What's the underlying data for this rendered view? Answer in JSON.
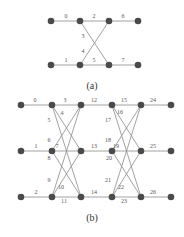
{
  "colors": {
    "node": "#4a4a4a",
    "edge": "#8a8a8a",
    "label": "#555555",
    "background": "#ffffff"
  },
  "diagram_a": {
    "caption": "(a)",
    "nodes": [
      {
        "id": "a0",
        "x": 51,
        "y": 21
      },
      {
        "id": "a1",
        "x": 80,
        "y": 21
      },
      {
        "id": "a2",
        "x": 109,
        "y": 21
      },
      {
        "id": "a3",
        "x": 138,
        "y": 21
      },
      {
        "id": "a4",
        "x": 51,
        "y": 65
      },
      {
        "id": "a5",
        "x": 80,
        "y": 65
      },
      {
        "id": "a6",
        "x": 109,
        "y": 65
      },
      {
        "id": "a7",
        "x": 138,
        "y": 65
      }
    ],
    "edges": [
      {
        "label": "0",
        "from": "a0",
        "to": "a1",
        "lx": 66,
        "ly": 18
      },
      {
        "label": "1",
        "from": "a4",
        "to": "a5",
        "lx": 66,
        "ly": 62
      },
      {
        "label": "2",
        "from": "a1",
        "to": "a2",
        "lx": 94,
        "ly": 18
      },
      {
        "label": "3",
        "from": "a1",
        "to": "a6",
        "lx": 83,
        "ly": 38
      },
      {
        "label": "4",
        "from": "a5",
        "to": "a2",
        "lx": 83,
        "ly": 53
      },
      {
        "label": "5",
        "from": "a5",
        "to": "a6",
        "lx": 94,
        "ly": 62
      },
      {
        "label": "6",
        "from": "a2",
        "to": "a3",
        "lx": 123,
        "ly": 18
      },
      {
        "label": "7",
        "from": "a6",
        "to": "a7",
        "lx": 123,
        "ly": 62
      }
    ]
  },
  "diagram_b": {
    "caption": "(b)",
    "nodes": [
      {
        "id": "b00",
        "x": 21,
        "y": 105
      },
      {
        "id": "b01",
        "x": 21,
        "y": 151
      },
      {
        "id": "b02",
        "x": 21,
        "y": 197
      },
      {
        "id": "b10",
        "x": 52,
        "y": 105
      },
      {
        "id": "b11",
        "x": 52,
        "y": 151
      },
      {
        "id": "b12",
        "x": 52,
        "y": 197
      },
      {
        "id": "b20",
        "x": 81,
        "y": 105
      },
      {
        "id": "b21",
        "x": 81,
        "y": 151
      },
      {
        "id": "b22",
        "x": 81,
        "y": 197
      },
      {
        "id": "b30",
        "x": 112,
        "y": 105
      },
      {
        "id": "b31",
        "x": 112,
        "y": 151
      },
      {
        "id": "b32",
        "x": 112,
        "y": 197
      },
      {
        "id": "b40",
        "x": 141,
        "y": 105
      },
      {
        "id": "b41",
        "x": 141,
        "y": 151
      },
      {
        "id": "b42",
        "x": 141,
        "y": 197
      },
      {
        "id": "b50",
        "x": 171,
        "y": 105
      },
      {
        "id": "b51",
        "x": 171,
        "y": 151
      },
      {
        "id": "b52",
        "x": 171,
        "y": 197
      }
    ],
    "edges": [
      {
        "label": "0",
        "from": "b00",
        "to": "b10",
        "lx": 35,
        "ly": 102
      },
      {
        "label": "1",
        "from": "b01",
        "to": "b11",
        "lx": 36,
        "ly": 148
      },
      {
        "label": "2",
        "from": "b02",
        "to": "b12",
        "lx": 36,
        "ly": 194
      },
      {
        "label": "3",
        "from": "b10",
        "to": "b20",
        "lx": 65,
        "ly": 102
      },
      {
        "label": "4",
        "from": "b10",
        "to": "b21",
        "lx": 62,
        "ly": 115
      },
      {
        "label": "5",
        "from": "b10",
        "to": "b22",
        "lx": 49,
        "ly": 122
      },
      {
        "label": "6",
        "from": "b11",
        "to": "b20",
        "lx": 49,
        "ly": 142
      },
      {
        "label": "7",
        "from": "b11",
        "to": "b21",
        "lx": 57,
        "ly": 148
      },
      {
        "label": "8",
        "from": "b11",
        "to": "b22",
        "lx": 49,
        "ly": 160
      },
      {
        "label": "9",
        "from": "b12",
        "to": "b20",
        "lx": 49,
        "ly": 182
      },
      {
        "label": "10",
        "from": "b12",
        "to": "b21",
        "lx": 61,
        "ly": 189
      },
      {
        "label": "11",
        "from": "b12",
        "to": "b22",
        "lx": 64,
        "ly": 203
      },
      {
        "label": "12",
        "from": "b20",
        "to": "b30",
        "lx": 94,
        "ly": 102
      },
      {
        "label": "13",
        "from": "b21",
        "to": "b31",
        "lx": 94,
        "ly": 148
      },
      {
        "label": "14",
        "from": "b22",
        "to": "b32",
        "lx": 94,
        "ly": 194
      },
      {
        "label": "15",
        "from": "b30",
        "to": "b40",
        "lx": 124,
        "ly": 102
      },
      {
        "label": "16",
        "from": "b30",
        "to": "b41",
        "lx": 120,
        "ly": 114
      },
      {
        "label": "17",
        "from": "b30",
        "to": "b42",
        "lx": 108,
        "ly": 122
      },
      {
        "label": "18",
        "from": "b31",
        "to": "b40",
        "lx": 108,
        "ly": 142
      },
      {
        "label": "19",
        "from": "b31",
        "to": "b41",
        "lx": 116,
        "ly": 148
      },
      {
        "label": "20",
        "from": "b31",
        "to": "b42",
        "lx": 109,
        "ly": 160
      },
      {
        "label": "21",
        "from": "b32",
        "to": "b40",
        "lx": 108,
        "ly": 182
      },
      {
        "label": "22",
        "from": "b32",
        "to": "b41",
        "lx": 121,
        "ly": 189
      },
      {
        "label": "23",
        "from": "b32",
        "to": "b42",
        "lx": 124,
        "ly": 203
      },
      {
        "label": "24",
        "from": "b40",
        "to": "b50",
        "lx": 153,
        "ly": 102
      },
      {
        "label": "25",
        "from": "b41",
        "to": "b51",
        "lx": 153,
        "ly": 148
      },
      {
        "label": "26",
        "from": "b42",
        "to": "b52",
        "lx": 153,
        "ly": 194
      }
    ]
  }
}
